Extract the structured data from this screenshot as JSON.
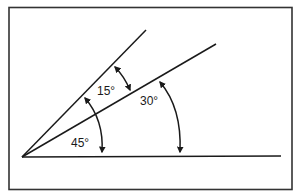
{
  "diagram": {
    "labels": {
      "angle_small": "15°",
      "angle_mid": "30°",
      "angle_large": "45°"
    },
    "colors": {
      "stroke": "#1a1a1a",
      "background": "#ffffff"
    }
  }
}
